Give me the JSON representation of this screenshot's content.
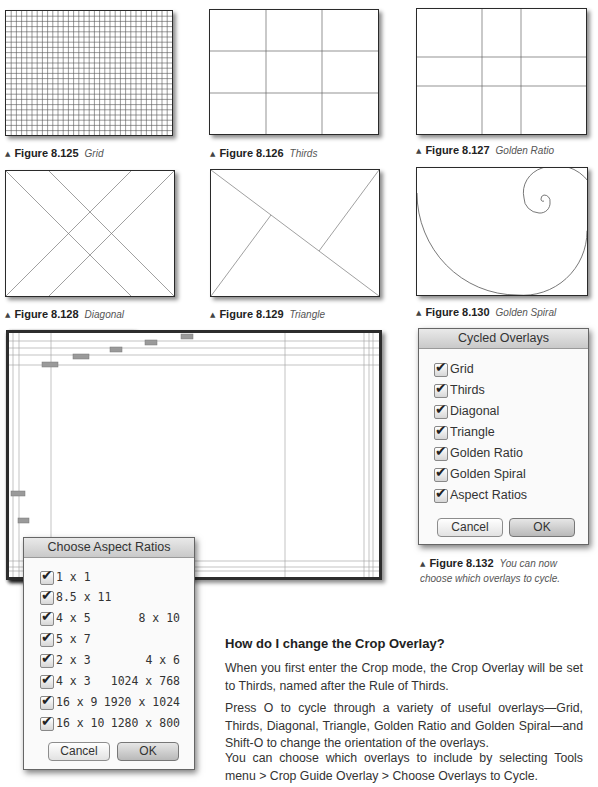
{
  "figures": [
    {
      "id": "fig-8-125",
      "number": "Figure 8.125",
      "title": "Grid"
    },
    {
      "id": "fig-8-126",
      "number": "Figure 8.126",
      "title": "Thirds"
    },
    {
      "id": "fig-8-127",
      "number": "Figure 8.127",
      "title": "Golden Ratio"
    },
    {
      "id": "fig-8-128",
      "number": "Figure 8.128",
      "title": "Diagonal"
    },
    {
      "id": "fig-8-129",
      "number": "Figure 8.129",
      "title": "Triangle"
    },
    {
      "id": "fig-8-130",
      "number": "Figure 8.130",
      "title": "Golden Spiral"
    }
  ],
  "cycled_overlays_dialog": {
    "title": "Cycled Overlays",
    "items": [
      {
        "label": "Grid",
        "checked": true
      },
      {
        "label": "Thirds",
        "checked": true
      },
      {
        "label": "Diagonal",
        "checked": true
      },
      {
        "label": "Triangle",
        "checked": true
      },
      {
        "label": "Golden Ratio",
        "checked": true
      },
      {
        "label": "Golden Spiral",
        "checked": true
      },
      {
        "label": "Aspect Ratios",
        "checked": true
      }
    ],
    "cancel_label": "Cancel",
    "ok_label": "OK"
  },
  "figure_132": {
    "number": "Figure 8.132",
    "title": "You can now choose which overlays to cycle.",
    "title_line1": "You can now",
    "title_line2": "choose which overlays to cycle."
  },
  "aspect_ratios_dialog": {
    "title": "Choose Aspect Ratios",
    "items": [
      {
        "label": "1 x 1",
        "alt": "",
        "checked": true
      },
      {
        "label": "8.5 x 11",
        "alt": "",
        "checked": true
      },
      {
        "label": "4 x 5",
        "alt": "8 x 10",
        "checked": true
      },
      {
        "label": "5 x 7",
        "alt": "",
        "checked": true
      },
      {
        "label": "2 x 3",
        "alt": "4 x 6",
        "checked": true
      },
      {
        "label": "4 x 3",
        "alt": "1024 x 768",
        "checked": true
      },
      {
        "label": "16 x 9",
        "alt": "1920 x 1024",
        "checked": true
      },
      {
        "label": "16 x 10",
        "alt": "1280 x 800",
        "checked": true
      }
    ],
    "cancel_label": "Cancel",
    "ok_label": "OK"
  },
  "article": {
    "heading": "How do I change the Crop Overlay?",
    "paragraphs": [
      "When you first enter the Crop mode, the Crop Overlay will be set to Thirds, named after the Rule of Thirds.",
      "Press O to cycle through a variety of useful overlays—Grid, Thirds, Diagonal, Triangle, Golden Ratio and Golden Spiral—and Shift-O to change the orientation of the overlays.",
      "You can choose which overlays to include by selecting Tools menu > Crop Guide Overlay > Choose Overlays to Cycle."
    ]
  },
  "colors": {
    "line": "#2a2a2a",
    "guide": "#9a9a9a",
    "dialog_bg": "#ececec"
  }
}
